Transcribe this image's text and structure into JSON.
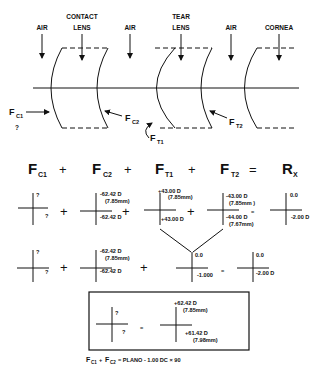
{
  "schematic": {
    "media_labels": {
      "air1": "AIR",
      "contact_lens_line1": "CONTACT",
      "contact_lens_line2": "LENS",
      "air2": "AIR",
      "tear_lens_line1": "TEAR",
      "tear_lens_line2": "LENS",
      "air3": "AIR",
      "cornea": "CORNEA"
    },
    "surface_labels": {
      "fc1": "F",
      "fc1_sub": "C1",
      "fc1_unknown": "?",
      "fc2": "F",
      "fc2_sub": "C2",
      "ft1": "F",
      "ft1_sub": "T1",
      "ft2": "F",
      "ft2_sub": "T2"
    }
  },
  "equation_header": {
    "terms": [
      {
        "main": "F",
        "sub": "C1"
      },
      {
        "main": "F",
        "sub": "C2"
      },
      {
        "main": "F",
        "sub": "T1"
      },
      {
        "main": "F",
        "sub": "T2"
      },
      {
        "main": "R",
        "sub": "X"
      }
    ],
    "plus": "+",
    "equals": "="
  },
  "row1": {
    "fc1": {
      "top": "?",
      "bottom": "?"
    },
    "fc2": {
      "top": "-62.42 D",
      "top_mm": "(7.85mm)",
      "bottom": "-62.42 D"
    },
    "ft1": {
      "top": "+43.00 D",
      "top_mm": "(7.85mm)",
      "bottom": "+43.00 D"
    },
    "ft2": {
      "top": "-43.00 D",
      "top_mm": "(7.85mm )",
      "bottom": "-44.00 D",
      "bottom_mm": "(7.67mm)"
    },
    "rx": {
      "top": "0.0",
      "bottom": "-2.00 D"
    }
  },
  "row2": {
    "fc1": {
      "top": "?",
      "bottom": "?"
    },
    "fc2": {
      "top": "-62.42 D",
      "top_mm": "(7.85mm)",
      "bottom": "-62.42 D"
    },
    "tear": {
      "top": "0.0",
      "bottom": "-1.000"
    },
    "rx": {
      "top": "0.0",
      "bottom": "-2.00 D"
    }
  },
  "result_box": {
    "left": {
      "top": "?",
      "bottom": "?"
    },
    "equals": "=",
    "right": {
      "top": "+62.42 D",
      "top_mm": "(7.85mm)",
      "bottom": "+61.42 D",
      "bottom_mm": "(7.98mm)"
    }
  },
  "caption": {
    "fc1": "F",
    "fc1_sub": "C1",
    "plus": "+",
    "fc2": "F",
    "fc2_sub": "C2",
    "text": "= PLANO - 1.00 DC × 90"
  }
}
